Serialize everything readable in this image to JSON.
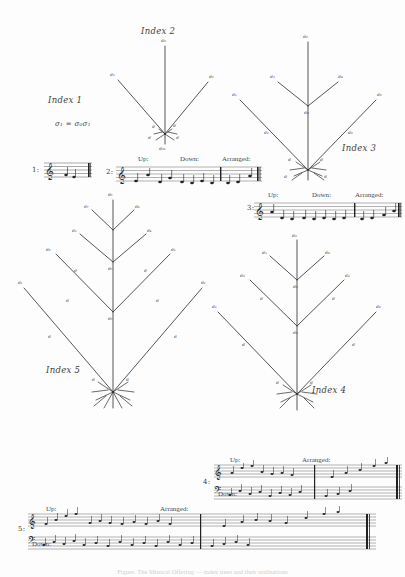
{
  "page": {
    "background_color": "#fdfdfd",
    "ink_color": "#2b2b2b",
    "caption": "Figure. The Musical Offering — index trees and their realisations"
  },
  "trees": [
    {
      "id": "index-1",
      "label": "Index 1",
      "formula": "σ₁ = σ₀σ₁",
      "levels": 0,
      "note": "label only, no drawn tree"
    },
    {
      "id": "index-2",
      "label": "Index 2",
      "levels": 1,
      "trunk_label": "σ₀",
      "branch_labels": [
        "σ₁",
        "σ₂"
      ],
      "root_label": "σ₀₁"
    },
    {
      "id": "index-3",
      "label": "Index 3",
      "levels": 2,
      "trunk_label": "σ₀",
      "branch_labels": [
        "σ₁",
        "σ₂",
        "σ₃",
        "σ₄"
      ],
      "root_label": "σ₀₁"
    },
    {
      "id": "index-4",
      "label": "Index 4",
      "levels": 3,
      "trunk_label": "σ₀",
      "branch_labels": [
        "σ₁",
        "σ₂",
        "σ₃",
        "σ₄",
        "σ₅",
        "σ₆"
      ],
      "root_label": "σ₀₁"
    },
    {
      "id": "index-5",
      "label": "Index 5",
      "levels": 4,
      "trunk_label": "σ₀",
      "branch_labels": [
        "σ₁",
        "σ₂",
        "σ₃",
        "σ₄",
        "σ₅",
        "σ₆",
        "σ₇",
        "σ₈"
      ],
      "root_label": "σ₀₁"
    }
  ],
  "staves": [
    {
      "id": "staff-1",
      "number": "1:",
      "system": "single",
      "clefs": [
        "treble"
      ],
      "sections": [],
      "measures": 1
    },
    {
      "id": "staff-2",
      "number": "2:",
      "system": "single",
      "clefs": [
        "treble"
      ],
      "sections": [
        "Up:",
        "Down:",
        "Arranged:"
      ],
      "measures": 3
    },
    {
      "id": "staff-3",
      "number": "3:",
      "system": "single",
      "clefs": [
        "treble"
      ],
      "sections": [
        "Up:",
        "Down:",
        "Arranged:"
      ],
      "measures": 3
    },
    {
      "id": "staff-4",
      "number": "4:",
      "system": "grand",
      "clefs": [
        "treble",
        "bass"
      ],
      "sections": [
        "Up:",
        "Down:",
        "Arranged:"
      ],
      "measures": 2
    },
    {
      "id": "staff-5",
      "number": "5:",
      "system": "grand",
      "clefs": [
        "treble",
        "bass"
      ],
      "sections": [
        "Up:",
        "Down:",
        "Arranged:"
      ],
      "measures": 2
    }
  ],
  "labels": {
    "up": "Up:",
    "down": "Down:",
    "arranged": "Arranged:"
  }
}
